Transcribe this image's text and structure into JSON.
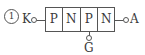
{
  "diagram": {
    "number_label": "1",
    "type": "thyristor-layer-structure",
    "layers": [
      "P",
      "N",
      "P",
      "N"
    ],
    "terminals": {
      "cathode": "K",
      "anode": "A",
      "gate": "G"
    },
    "gate_attached_layer_index": 2,
    "line_color": "#555555"
  }
}
